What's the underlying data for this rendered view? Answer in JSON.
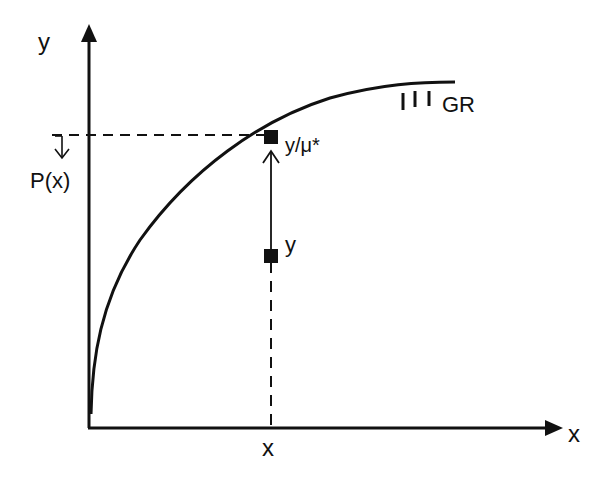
{
  "diagram": {
    "type": "production-possibility / distance function illustration",
    "axes": {
      "x_label": "x",
      "y_label": "y"
    },
    "frontier": {
      "label": "GR",
      "hatch_marks": "III",
      "shape": "concave increasing curve from origin"
    },
    "points": [
      {
        "id": "observed",
        "label": "y",
        "x_label": "x"
      },
      {
        "id": "projected",
        "label": "y/μ*"
      }
    ],
    "annotations": {
      "x_tick_label": "x",
      "output_level_label": "P(x)",
      "arrow": "vertical projection from y up to y/μ*"
    },
    "colors": {
      "ink": "#111111",
      "background": "#ffffff"
    }
  }
}
